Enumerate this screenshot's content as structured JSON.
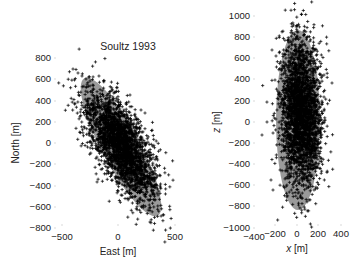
{
  "chart_data": [
    {
      "type": "scatter",
      "title": "Soultz 1993",
      "xlabel": "East [m]",
      "ylabel": "North [m]",
      "xlim": [
        -500,
        500
      ],
      "ylim": [
        -800,
        800
      ],
      "xticks": [
        -500,
        0,
        500
      ],
      "yticks": [
        -800,
        -600,
        -400,
        -200,
        0,
        200,
        400,
        600,
        800
      ],
      "grid": false,
      "marker": "+",
      "series": [
        {
          "name": "events",
          "description": "Dense cloud of microseismic event locations elongated NNW-SSE",
          "extent": {
            "east": [
              -230,
              380
            ],
            "north": [
              -700,
              700
            ]
          },
          "center": {
            "east": 20,
            "north": -40
          }
        }
      ],
      "ellipse": {
        "center": {
          "east": 20,
          "north": -40
        },
        "semi_major": 720,
        "semi_minor": 160,
        "orientation_deg_from_north": -28,
        "color": "#9a9a9a"
      }
    },
    {
      "type": "scatter",
      "title": "",
      "xlabel": "x [m]",
      "ylabel": "z [m]",
      "xlim": [
        -400,
        400
      ],
      "ylim": [
        -1000,
        1000
      ],
      "xticks": [
        -400,
        -200,
        0,
        200,
        400
      ],
      "yticks": [
        -1000,
        -800,
        -600,
        -400,
        -200,
        0,
        200,
        400,
        600,
        800,
        1000
      ],
      "grid": false,
      "marker": "+",
      "series": [
        {
          "name": "events",
          "description": "Dense vertical cloud of event locations",
          "extent": {
            "x": [
              -280,
              390
            ],
            "z": [
              -700,
              820
            ]
          },
          "center": {
            "x": 0,
            "z": 0
          }
        }
      ],
      "ellipse": {
        "center": {
          "x": 0,
          "z": 20
        },
        "semi_major": 860,
        "semi_minor": 215,
        "orientation_deg_from_vertical": 0,
        "color": "#9a9a9a"
      }
    }
  ],
  "left_plot": {
    "title": "Soultz 1993",
    "xlabel": "East [m]",
    "ylabel": "North [m]",
    "xticks": [
      "−500",
      "0",
      "500"
    ],
    "yticks": [
      "800",
      "600",
      "400",
      "200",
      "0",
      "−200",
      "−400",
      "−600",
      "−800"
    ]
  },
  "right_plot": {
    "xlabel_var": "x",
    "xlabel_unit": " [m]",
    "ylabel_var": "z",
    "ylabel_unit": " [m]",
    "xticks": [
      "−400",
      "−200",
      "0",
      "200",
      "400"
    ],
    "yticks": [
      "1000",
      "800",
      "600",
      "400",
      "200",
      "0",
      "−200",
      "−400",
      "−600",
      "−800",
      "−1000"
    ]
  }
}
